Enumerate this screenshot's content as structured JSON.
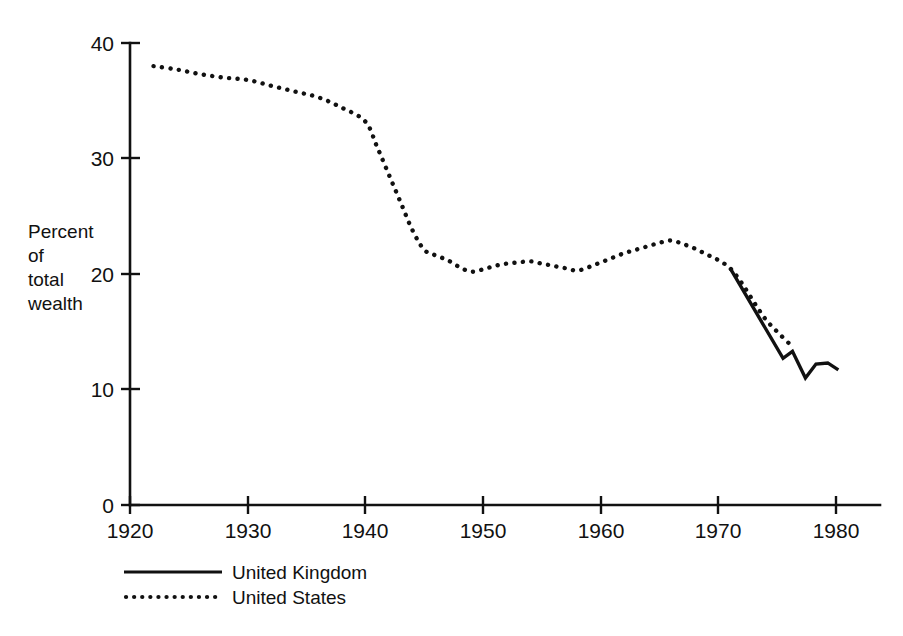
{
  "figure": {
    "background_color": "#ffffff",
    "ink_color": "#111111"
  },
  "axes": {
    "y_label_lines": [
      "Percent",
      "of",
      "total",
      "wealth"
    ],
    "y_ticks": [
      "0",
      "10",
      "20",
      "30",
      "40"
    ],
    "x_ticks": [
      "1920",
      "1930",
      "1940",
      "1950",
      "1960",
      "1970",
      "1980"
    ]
  },
  "legend": {
    "entries": [
      {
        "label": "United Kingdom",
        "style": "solid"
      },
      {
        "label": "United States",
        "style": "dotted"
      }
    ]
  },
  "chart_data": {
    "type": "line",
    "title": "",
    "subtitle": "",
    "xlabel": "",
    "ylabel": "Percent of total wealth",
    "xlim": [
      1920,
      1980
    ],
    "ylim": [
      0,
      40
    ],
    "xticks": [
      1920,
      1930,
      1940,
      1950,
      1960,
      1970,
      1980
    ],
    "yticks": [
      0,
      10,
      20,
      30,
      40
    ],
    "grid": false,
    "legend_position": "below-axes-left",
    "series": [
      {
        "name": "United States",
        "style": "dotted",
        "color": "#111111",
        "x": [
          1922,
          1924,
          1926,
          1928,
          1930,
          1932,
          1934,
          1936,
          1938,
          1940,
          1941,
          1942,
          1943,
          1944,
          1945,
          1946,
          1947,
          1948,
          1949,
          1950,
          1951,
          1952,
          1953,
          1954,
          1955,
          1956,
          1957,
          1958,
          1959,
          1960,
          1961,
          1962,
          1963,
          1964,
          1965,
          1966,
          1967,
          1968,
          1969,
          1970,
          1971,
          1972,
          1973,
          1974,
          1975,
          1976
        ],
        "y": [
          38.0,
          37.7,
          37.3,
          37.0,
          36.8,
          36.3,
          35.8,
          35.3,
          34.4,
          33.2,
          31.0,
          28.6,
          26.2,
          23.8,
          22.1,
          21.6,
          21.2,
          20.6,
          20.2,
          20.4,
          20.7,
          20.9,
          21.0,
          21.1,
          20.9,
          20.7,
          20.5,
          20.3,
          20.6,
          21.0,
          21.4,
          21.8,
          22.1,
          22.4,
          22.7,
          22.9,
          22.6,
          22.2,
          21.7,
          21.2,
          20.5,
          19.2,
          17.6,
          16.1,
          15.0,
          14.0
        ]
      },
      {
        "name": "United Kingdom",
        "style": "solid",
        "color": "#111111",
        "x": [
          1971,
          1975.5,
          1976.3,
          1977.4,
          1978.3,
          1979.3,
          1980.2
        ],
        "y": [
          20.5,
          12.7,
          13.3,
          11.0,
          12.2,
          12.3,
          11.7
        ]
      }
    ]
  }
}
